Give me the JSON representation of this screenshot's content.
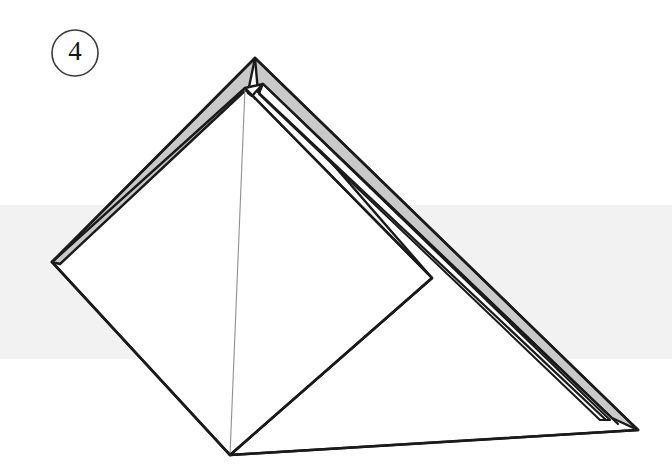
{
  "diagram": {
    "type": "paper-folding-instruction",
    "step_badge": {
      "label": "4",
      "shape": "circle",
      "center_x": 75,
      "center_y": 53,
      "radius": 23,
      "stroke_color": "#3a3a3a",
      "text_color": "#141414"
    },
    "canvas": {
      "width": 672,
      "height": 473,
      "background_color": "#ffffff"
    },
    "background_band": {
      "name": "horizontal-shadow-band",
      "color": "#f2f2f3",
      "top": 205,
      "bottom": 359,
      "left": 0,
      "right": 672
    },
    "colors": {
      "ink": "#1a1a1a",
      "flap_fill": "#c9c9c9",
      "paper_fill": "#ffffff",
      "fold_line": "#8f8f8f",
      "band": "#f2f2f3"
    },
    "vertices": {
      "apex_top": [
        255,
        58
      ],
      "apex_inner": [
        245,
        88
      ],
      "notch_peak": [
        263,
        84
      ],
      "notch_valley": [
        252,
        96
      ],
      "left_point": [
        52,
        262
      ],
      "diamond_right": [
        432,
        278
      ],
      "bottom_point": [
        230,
        455
      ],
      "far_right": [
        638,
        430
      ]
    },
    "shapes": [
      {
        "name": "rear-flap-left",
        "fill": "flap_fill",
        "description": "narrow grey wedge along the upper-left edge"
      },
      {
        "name": "rear-flap-right",
        "fill": "flap_fill",
        "description": "long grey wedge running down the upper-right edge"
      },
      {
        "name": "front-kite-panel",
        "fill": "paper_fill",
        "description": "white diamond panel facing viewer"
      },
      {
        "name": "right-base-panel",
        "fill": "paper_fill",
        "description": "white triangular panel at lower right"
      },
      {
        "name": "center-fold-line",
        "stroke": "fold_line",
        "description": "thin vertical crease from apex to bottom point"
      }
    ],
    "outline_paths": {
      "left_flap": "M 255 58 L 52 262 L 60 264 L 249 86 Z",
      "right_flap_outer": "M 255 58 L 638 430 L 628 430 L 252 96 Z",
      "right_flap_inner": "M 263 84 L 596 420 L 590 415 L 257 93 Z",
      "kite_panel": "M 245 88 L 52 262 L 230 455 L 432 278 Z",
      "base_panel": "M 252 96 L 432 278 L 230 455 L 638 430 Z",
      "center_crease": "M 244 88 L 230 455"
    }
  }
}
